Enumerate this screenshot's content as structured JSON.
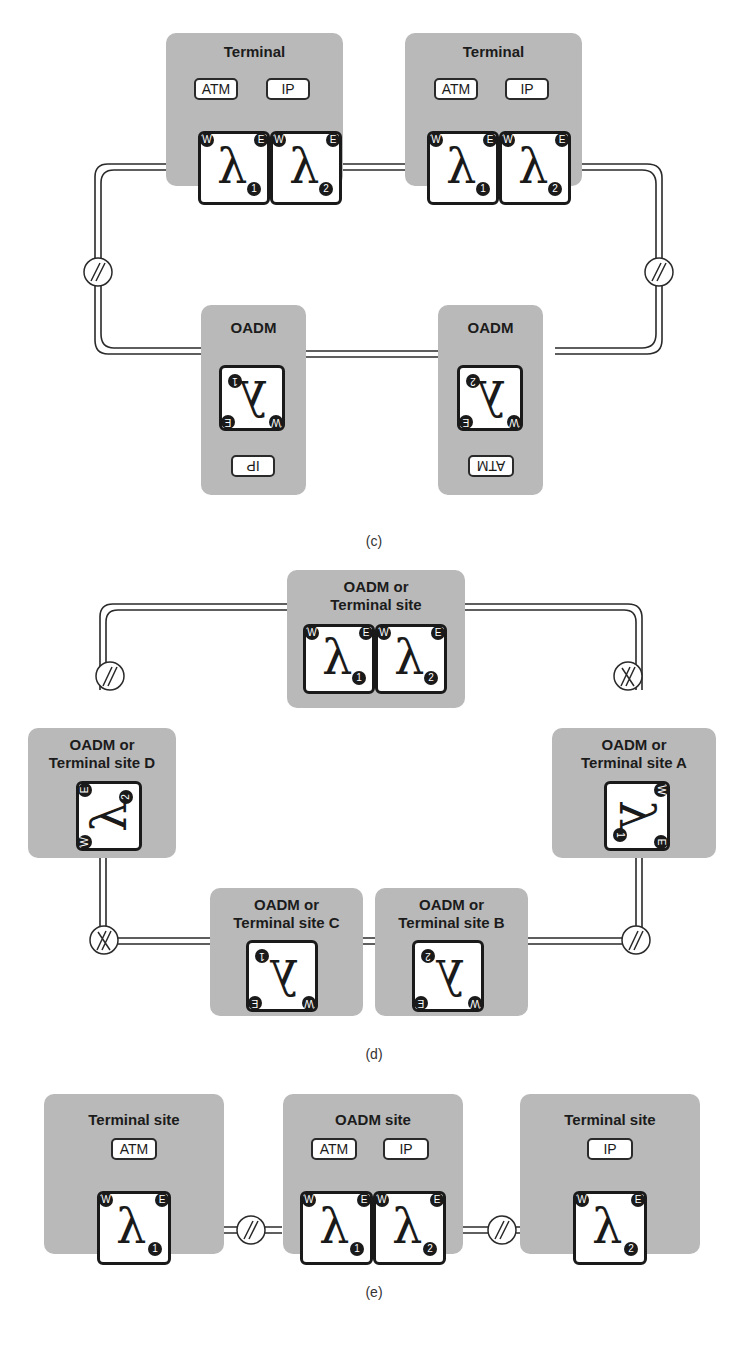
{
  "figure": {
    "subfigures": [
      {
        "id": "c",
        "caption": "(c)",
        "sites": [
          {
            "title": "Terminal",
            "clients": [
              "ATM",
              "IP"
            ],
            "cards": [
              {
                "lambda": "λ",
                "index": "1",
                "ports": [
                  "W",
                  "E"
                ]
              },
              {
                "lambda": "λ",
                "index": "2",
                "ports": [
                  "W",
                  "E"
                ]
              }
            ]
          },
          {
            "title": "Terminal",
            "clients": [
              "ATM",
              "IP"
            ],
            "cards": [
              {
                "lambda": "λ",
                "index": "1",
                "ports": [
                  "W",
                  "E"
                ]
              },
              {
                "lambda": "λ",
                "index": "2",
                "ports": [
                  "W",
                  "E"
                ]
              }
            ]
          },
          {
            "title": "OADM",
            "clients": [
              "IP"
            ],
            "cards": [
              {
                "lambda": "λ",
                "index": "1",
                "ports": [
                  "W",
                  "E"
                ]
              }
            ]
          },
          {
            "title": "OADM",
            "clients": [
              "ATM"
            ],
            "cards": [
              {
                "lambda": "λ",
                "index": "2",
                "ports": [
                  "W",
                  "E"
                ]
              }
            ]
          }
        ]
      },
      {
        "id": "d",
        "caption": "(d)",
        "sites": [
          {
            "title_line1": "OADM or",
            "title_line2": "Terminal site",
            "cards": [
              {
                "lambda": "λ",
                "index": "1",
                "ports": [
                  "W",
                  "E"
                ]
              },
              {
                "lambda": "λ",
                "index": "2",
                "ports": [
                  "W",
                  "E"
                ]
              }
            ]
          },
          {
            "title_line1": "OADM or",
            "title_line2": "Terminal site D",
            "cards": [
              {
                "lambda": "λ",
                "index": "2",
                "ports": [
                  "W",
                  "E"
                ]
              }
            ]
          },
          {
            "title_line1": "OADM or",
            "title_line2": "Terminal site A",
            "cards": [
              {
                "lambda": "λ",
                "index": "1",
                "ports": [
                  "W",
                  "E"
                ]
              }
            ]
          },
          {
            "title_line1": "OADM or",
            "title_line2": "Terminal site C",
            "cards": [
              {
                "lambda": "λ",
                "index": "1",
                "ports": [
                  "W",
                  "E"
                ]
              }
            ]
          },
          {
            "title_line1": "OADM or",
            "title_line2": "Terminal site B",
            "cards": [
              {
                "lambda": "λ",
                "index": "2",
                "ports": [
                  "W",
                  "E"
                ]
              }
            ]
          }
        ]
      },
      {
        "id": "e",
        "caption": "(e)",
        "sites": [
          {
            "title": "Terminal site",
            "clients": [
              "ATM"
            ],
            "cards": [
              {
                "lambda": "λ",
                "index": "1",
                "ports": [
                  "W",
                  "E"
                ]
              }
            ]
          },
          {
            "title": "OADM site",
            "clients": [
              "ATM",
              "IP"
            ],
            "cards": [
              {
                "lambda": "λ",
                "index": "1",
                "ports": [
                  "W",
                  "E"
                ]
              },
              {
                "lambda": "λ",
                "index": "2",
                "ports": [
                  "W",
                  "E"
                ]
              }
            ]
          },
          {
            "title": "Terminal site",
            "clients": [
              "IP"
            ],
            "cards": [
              {
                "lambda": "λ",
                "index": "2",
                "ports": [
                  "W",
                  "E"
                ]
              }
            ]
          }
        ]
      }
    ],
    "colors": {
      "site_bg": "#b9b9b9",
      "card_bg": "#ffffff",
      "line": "#1a1a1a"
    }
  }
}
